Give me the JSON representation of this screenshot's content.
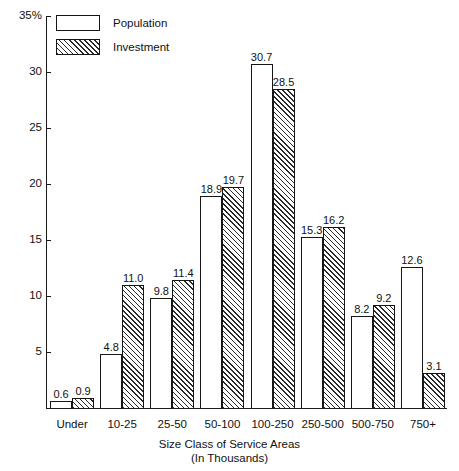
{
  "chart_data": {
    "type": "bar",
    "title": "",
    "xlabel": "Size Class of Service Areas (In Thousands)",
    "xlabel_line1": "Size Class of Service Areas",
    "xlabel_line2": "(In Thousands)",
    "ylabel": "",
    "ylim": [
      0,
      35
    ],
    "yunit": "%",
    "grid": false,
    "legend_position": "top-left",
    "ytick_labels": [
      "35%",
      "30",
      "25",
      "20",
      "15",
      "10",
      "5"
    ],
    "ytick_values": [
      35,
      30,
      25,
      20,
      15,
      10,
      5
    ],
    "categories": [
      "Under",
      "10-25",
      "25-50",
      "50-100",
      "100-250",
      "250-500",
      "500-750",
      "750+"
    ],
    "series": [
      {
        "name": "Population",
        "values": [
          0.6,
          4.8,
          9.8,
          18.9,
          30.7,
          15.3,
          8.2,
          12.6
        ],
        "labels": [
          "0.6",
          "4.8",
          "9.8",
          "18.9",
          "30.7",
          "15.3",
          "8.2",
          "12.6"
        ],
        "fill": "none"
      },
      {
        "name": "Investment",
        "values": [
          0.9,
          11.0,
          11.4,
          19.7,
          28.5,
          16.2,
          9.2,
          3.1
        ],
        "labels": [
          "0.9",
          "11.0",
          "11.4",
          "19.7",
          "28.5",
          "16.2",
          "9.2",
          "3.1"
        ],
        "fill": "diagonal-hatch"
      }
    ]
  },
  "legend": {
    "items": [
      {
        "label": "Population",
        "swatch": "open-box-swatch"
      },
      {
        "label": "Investment",
        "swatch": "hatched-box-swatch"
      }
    ]
  },
  "colors": {
    "axis": "#1a1a1a",
    "bar_outline": "#151515",
    "hatch": "#2a2a2a",
    "background": "#ffffff",
    "text": "#111111"
  }
}
